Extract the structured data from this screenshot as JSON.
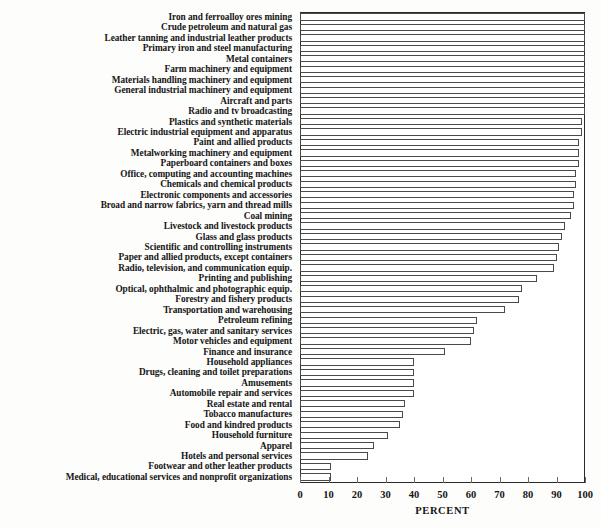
{
  "chart_data": {
    "type": "bar",
    "orientation": "horizontal",
    "title": "",
    "xlabel": "PERCENT",
    "ylabel": "",
    "xlim": [
      0,
      100
    ],
    "xticks": [
      0,
      10,
      20,
      30,
      40,
      50,
      60,
      70,
      80,
      90,
      100
    ],
    "xticklabels": [
      "0",
      "10",
      "20",
      "30",
      "40",
      "50",
      "60",
      "70",
      "80",
      "90",
      "100"
    ],
    "grid": false,
    "legend": null,
    "bar_facecolor": "#ffffff",
    "bar_edgecolor": "#4a4a4a",
    "axis_color": "#2a2a2a",
    "categories": [
      "Iron and ferroalloy ores mining",
      "Crude petroleum and natural gas",
      "Leather tanning and industrial leather products",
      "Primary iron and steel manufacturing",
      "Metal containers",
      "Farm machinery and equipment",
      "Materials handling machinery and equipment",
      "General industrial machinery and equipment",
      "Aircraft and parts",
      "Radio and tv broadcasting",
      "Plastics and synthetic materials",
      "Electric industrial equipment and apparatus",
      "Paint and allied products",
      "Metalworking machinery and equipment",
      "Paperboard containers and boxes",
      "Office, computing and accounting machines",
      "Chemicals and chemical products",
      "Electronic components and accessories",
      "Broad and narrow fabrics, yarn and thread mills",
      "Coal mining",
      "Livestock and livestock products",
      "Glass and glass products",
      "Scientific and controlling instruments",
      "Paper and allied products, except containers",
      "Radio, television, and communication equip.",
      "Printing and publishing",
      "Optical, ophthalmic and photographic equip.",
      "Forestry and fishery products",
      "Transportation and warehousing",
      "Petroleum refining",
      "Electric, gas, water and sanitary services",
      "Motor vehicles and equipment",
      "Finance and insurance",
      "Household appliances",
      "Drugs, cleaning and toilet preparations",
      "Amusements",
      "Automobile repair and services",
      "Real estate and rental",
      "Tobacco manufactures",
      "Food and kindred products",
      "Household furniture",
      "Apparel",
      "Hotels and personal services",
      "Footwear and other leather products",
      "Medical, educational services and nonprofit organizations"
    ],
    "values": [
      100,
      100,
      100,
      100,
      100,
      100,
      100,
      100,
      100,
      100,
      99,
      99,
      98,
      98,
      98,
      97,
      97,
      96,
      96,
      95,
      93,
      92,
      91,
      90,
      89,
      83,
      78,
      77,
      72,
      62,
      61,
      60,
      51,
      40,
      40,
      40,
      40,
      37,
      36,
      35,
      31,
      26,
      24,
      11,
      11
    ]
  }
}
